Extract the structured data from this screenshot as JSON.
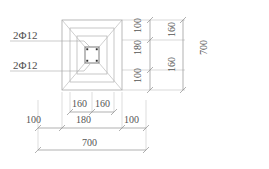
{
  "drawing": {
    "type": "structural-footing-plan",
    "units": "mm",
    "rebar_labels": [
      {
        "id": "rebar-top",
        "text": "2Φ12"
      },
      {
        "id": "rebar-bottom",
        "text": "2Φ12"
      }
    ],
    "dimensions": {
      "right_inner_chain": [
        "100",
        "180",
        "100"
      ],
      "right_outer_chain": [
        "160",
        "160"
      ],
      "right_overall": "700",
      "bottom_upper_chain": [
        "160",
        "160"
      ],
      "bottom_middle_chain": [
        "100",
        "180",
        "100"
      ],
      "bottom_overall": "700"
    },
    "colors": {
      "line": "#9a9a9a",
      "line_light": "#b9b9b9",
      "text": "#555555",
      "node": "#2b2b2b",
      "background": "#ffffff"
    }
  }
}
